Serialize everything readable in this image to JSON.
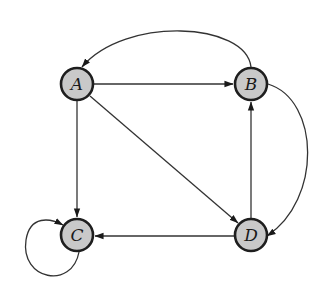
{
  "diagram": {
    "type": "directed-graph",
    "style": {
      "node_fill": "#c9c9c9",
      "node_stroke": "#1e1e1e",
      "edge_color": "#333333",
      "background": "#ffffff"
    },
    "nodes": [
      {
        "id": "A",
        "label": "A",
        "x": 77,
        "y": 84
      },
      {
        "id": "B",
        "label": "B",
        "x": 251,
        "y": 84
      },
      {
        "id": "C",
        "label": "C",
        "x": 77,
        "y": 235
      },
      {
        "id": "D",
        "label": "D",
        "x": 251,
        "y": 235
      }
    ],
    "edges": [
      {
        "from": "A",
        "to": "B",
        "shape": "straight"
      },
      {
        "from": "A",
        "to": "C",
        "shape": "straight"
      },
      {
        "from": "A",
        "to": "D",
        "shape": "straight"
      },
      {
        "from": "D",
        "to": "B",
        "shape": "straight"
      },
      {
        "from": "D",
        "to": "C",
        "shape": "straight"
      },
      {
        "from": "B",
        "to": "A",
        "shape": "curved-top"
      },
      {
        "from": "B",
        "to": "D",
        "shape": "curved-right"
      },
      {
        "from": "C",
        "to": "C",
        "shape": "self-loop"
      }
    ]
  }
}
